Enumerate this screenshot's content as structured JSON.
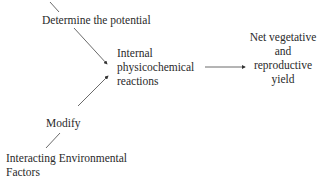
{
  "diagram": {
    "nodes": {
      "determine": {
        "label": "Determine the potential"
      },
      "internal": {
        "lines": [
          "Internal",
          "physicochemical",
          "reactions"
        ]
      },
      "yield": {
        "lines": [
          "Net vegetative",
          "and",
          "reproductive",
          "yield"
        ]
      },
      "modify": {
        "label": "Modify"
      },
      "environment": {
        "lines": [
          "Interacting Environmental",
          "Factors"
        ]
      }
    },
    "edges": [
      {
        "from": "top-offscreen",
        "to": "determine"
      },
      {
        "from": "determine",
        "to": "internal",
        "arrow": true
      },
      {
        "from": "modify",
        "to": "internal",
        "arrow": true
      },
      {
        "from": "environment",
        "to": "modify"
      },
      {
        "from": "internal",
        "to": "yield",
        "arrow": true
      }
    ],
    "colors": {
      "text": "#2a2a2a",
      "line": "#333333",
      "background": "#ffffff"
    }
  }
}
